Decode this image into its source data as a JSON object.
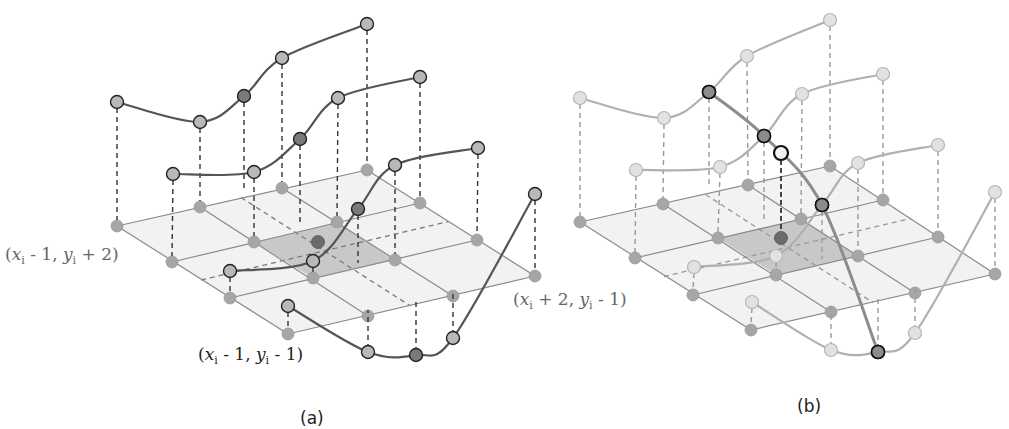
{
  "figure": {
    "panels": [
      {
        "id": "a",
        "caption": "(a)",
        "caption_pos": [
          300,
          408
        ],
        "style": "highlight-all",
        "grid_rows": [
          [
            [
              117,
              226
            ],
            [
              200,
              207
            ],
            [
              282,
              188
            ],
            [
              367,
              170
            ]
          ],
          [
            [
              172,
              262
            ],
            [
              254,
              242
            ],
            [
              337,
              222
            ],
            [
              420,
              203
            ]
          ],
          [
            [
              230,
              298
            ],
            [
              313,
              278
            ],
            [
              395,
              260
            ],
            [
              477,
              240
            ]
          ],
          [
            [
              288,
              334
            ],
            [
              368,
              316
            ],
            [
              453,
              296
            ],
            [
              535,
              276
            ]
          ]
        ],
        "center_cell": [
          [
            254,
            242
          ],
          [
            337,
            222
          ],
          [
            395,
            260
          ],
          [
            313,
            278
          ]
        ],
        "center_point": [
          318,
          242
        ],
        "curves": [
          {
            "points": [
              [
                117,
                102
              ],
              [
                200,
                122
              ],
              [
                244,
                96
              ],
              [
                282,
                58
              ],
              [
                367,
                24
              ]
            ],
            "feet": [
              [
                117,
                226
              ],
              [
                200,
                207
              ],
              [
                244,
                198
              ],
              [
                282,
                188
              ],
              [
                367,
                170
              ]
            ],
            "dark": [
              2
            ]
          },
          {
            "points": [
              [
                173,
                174
              ],
              [
                254,
                172
              ],
              [
                300,
                139
              ],
              [
                338,
                98
              ],
              [
                420,
                77
              ]
            ],
            "feet": [
              [
                172,
                262
              ],
              [
                254,
                242
              ],
              [
                300,
                232
              ],
              [
                337,
                222
              ],
              [
                420,
                203
              ]
            ],
            "dark": [
              2
            ]
          },
          {
            "points": [
              [
                230,
                271
              ],
              [
                313,
                261
              ],
              [
                358,
                209
              ],
              [
                395,
                165
              ],
              [
                478,
                148
              ]
            ],
            "feet": [
              [
                230,
                298
              ],
              [
                313,
                278
              ],
              [
                358,
                269
              ],
              [
                395,
                260
              ],
              [
                477,
                240
              ]
            ],
            "dark": [
              2
            ]
          },
          {
            "points": [
              [
                288,
                306
              ],
              [
                368,
                352
              ],
              [
                416,
                355
              ],
              [
                453,
                338
              ],
              [
                535,
                194
              ]
            ],
            "feet": [
              [
                288,
                334
              ],
              [
                368,
                316
              ],
              [
                416,
                306
              ],
              [
                453,
                296
              ],
              [
                535,
                276
              ]
            ],
            "dark": [
              2
            ]
          }
        ],
        "vertical_curve": null,
        "labels": [
          {
            "text_pre": "(",
            "x_var": "x",
            "sub1": "i",
            "mid": " - 1, ",
            "y_var": "y",
            "sub2": "i",
            "post": " + 2)",
            "pos": [
              5,
              244
            ],
            "dark": false
          },
          {
            "text_pre": "(",
            "x_var": "x",
            "sub1": "i",
            "mid": " - 1, ",
            "y_var": "y",
            "sub2": "i",
            "post": " - 1)",
            "pos": [
              198,
              344
            ],
            "dark": true
          },
          {
            "text_pre": "(",
            "x_var": "x",
            "sub1": "i",
            "mid": " + 2, ",
            "y_var": "y",
            "sub2": "i",
            "post": " - 1)",
            "pos": [
              513,
              289
            ],
            "dark": false
          }
        ]
      },
      {
        "id": "b",
        "caption": "(b)",
        "caption_pos": [
          797,
          396
        ],
        "style": "faded-with-vertical",
        "grid_rows": [
          [
            [
              580,
              222
            ],
            [
              663,
              204
            ],
            [
              748,
              185
            ],
            [
              830,
              166
            ]
          ],
          [
            [
              635,
              258
            ],
            [
              718,
              238
            ],
            [
              801,
              219
            ],
            [
              883,
              200
            ]
          ],
          [
            [
              693,
              295
            ],
            [
              776,
              275
            ],
            [
              858,
              256
            ],
            [
              938,
              237
            ]
          ],
          [
            [
              751,
              330
            ],
            [
              831,
              312
            ],
            [
              915,
              293
            ],
            [
              995,
              274
            ]
          ]
        ],
        "center_cell": [
          [
            718,
            238
          ],
          [
            801,
            219
          ],
          [
            858,
            256
          ],
          [
            776,
            275
          ]
        ],
        "center_point": [
          781,
          238
        ],
        "curves": [
          {
            "points": [
              [
                580,
                98
              ],
              [
                664,
                118
              ],
              [
                709,
                92
              ],
              [
                747,
                56
              ],
              [
                830,
                20
              ]
            ],
            "feet": [
              [
                580,
                222
              ],
              [
                663,
                204
              ],
              [
                709,
                194
              ],
              [
                748,
                185
              ],
              [
                830,
                166
              ]
            ],
            "dark": [
              2
            ]
          },
          {
            "points": [
              [
                636,
                170
              ],
              [
                720,
                167
              ],
              [
                764,
                136
              ],
              [
                802,
                94
              ],
              [
                883,
                74
              ]
            ],
            "feet": [
              [
                635,
                258
              ],
              [
                718,
                238
              ],
              [
                764,
                228
              ],
              [
                801,
                219
              ],
              [
                883,
                200
              ]
            ],
            "dark": [
              2
            ]
          },
          {
            "points": [
              [
                694,
                267
              ],
              [
                776,
                256
              ],
              [
                822,
                205
              ],
              [
                858,
                163
              ],
              [
                938,
                145
              ]
            ],
            "feet": [
              [
                693,
                295
              ],
              [
                776,
                275
              ],
              [
                822,
                265
              ],
              [
                858,
                256
              ],
              [
                938,
                237
              ]
            ],
            "dark": [
              2
            ]
          },
          {
            "points": [
              [
                752,
                302
              ],
              [
                831,
                350
              ],
              [
                878,
                352
              ],
              [
                915,
                333
              ],
              [
                995,
                192
              ]
            ],
            "feet": [
              [
                751,
                330
              ],
              [
                831,
                312
              ],
              [
                878,
                302
              ],
              [
                915,
                293
              ],
              [
                995,
                274
              ]
            ],
            "dark": [
              2
            ]
          }
        ],
        "vertical_curve": {
          "points": [
            [
              709,
              92
            ],
            [
              764,
              136
            ],
            [
              822,
              205
            ],
            [
              878,
              352
            ]
          ],
          "query_point": [
            781,
            153
          ],
          "query_foot": [
            781,
            238
          ]
        },
        "labels": []
      }
    ],
    "colors": {
      "grid_fill": "#f2f2f2",
      "grid_line": "#8a8a8a",
      "center_fill": "#c8c8c8",
      "node_fill": "#a6a6a6",
      "curve_a": "#555555",
      "curve_b": "#b0b0b0",
      "point_fill_a": "#b8b8b8",
      "point_dark_a": "#7a7a7a",
      "point_fill_b": "#e2e2e2",
      "point_stroke_b": "#b5b5b5",
      "highlight_stroke": "#111111",
      "center_point": "#6b6b6b",
      "dashed": "#333333",
      "dashed_b": "#999999",
      "vertical_curve": "#8c8c8c"
    }
  }
}
